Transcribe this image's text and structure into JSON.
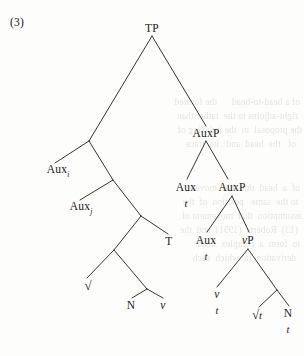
{
  "figure": {
    "example_number": "(3)",
    "type": "syntax-tree",
    "notation": "X-bar / bare phrase structure tree with traces"
  },
  "tree": {
    "root_label": "TP",
    "nodes": [
      {
        "id": "tp",
        "label": "TP",
        "x": 152,
        "y": 28,
        "style": "plain",
        "trace": null
      },
      {
        "id": "auxp1",
        "label": "AuxP",
        "x": 206,
        "y": 133,
        "style": "plain",
        "trace": null
      },
      {
        "id": "auxi",
        "label": "Aux",
        "x": 58,
        "y": 171,
        "style": "subscript",
        "subscript": "i",
        "trace": null
      },
      {
        "id": "auxj",
        "label": "Aux",
        "x": 81,
        "y": 208,
        "style": "subscript",
        "subscript": "j",
        "trace": null
      },
      {
        "id": "aux-t1",
        "label": "Aux",
        "x": 186,
        "y": 187,
        "style": "plain",
        "trace": "t"
      },
      {
        "id": "auxp2",
        "label": "AuxP",
        "x": 232,
        "y": 187,
        "style": "plain",
        "trace": null
      },
      {
        "id": "t-node",
        "label": "T",
        "x": 169,
        "y": 241,
        "style": "plain",
        "trace": null
      },
      {
        "id": "aux-t2",
        "label": "Aux",
        "x": 206,
        "y": 240,
        "style": "plain",
        "trace": "t"
      },
      {
        "id": "vp",
        "label": "vP",
        "x": 248,
        "y": 240,
        "style": "italic-v",
        "trace": null
      },
      {
        "id": "root-left",
        "label": "√",
        "x": 88,
        "y": 286,
        "style": "radical",
        "trace": null
      },
      {
        "id": "n-left",
        "label": "N",
        "x": 131,
        "y": 305,
        "style": "plain",
        "trace": null
      },
      {
        "id": "v-left",
        "label": "v",
        "x": 163,
        "y": 305,
        "style": "italic",
        "trace": null
      },
      {
        "id": "v-t",
        "label": "v",
        "x": 217,
        "y": 294,
        "style": "italic",
        "trace": "t"
      },
      {
        "id": "root-t",
        "label": "√t",
        "x": 257,
        "y": 315,
        "style": "radical-it",
        "trace": null
      },
      {
        "id": "n-t",
        "label": "N",
        "x": 288,
        "y": 313,
        "style": "plain",
        "trace": "t"
      }
    ],
    "terminal_traces": [
      "t",
      "t",
      "t",
      "t"
    ],
    "labels_flat": [
      "TP",
      "AuxP",
      "Aux i",
      "Aux j",
      "Aux",
      "t",
      "AuxP",
      "T",
      "Aux",
      "t",
      "vP",
      "√",
      "N",
      "v",
      "v",
      "t",
      "√t",
      "N",
      "t"
    ]
  },
  "edges": [
    {
      "from": "tp",
      "to": "n1",
      "x1": 152,
      "y1": 36,
      "x2": 89,
      "y2": 141
    },
    {
      "from": "tp",
      "to": "auxp1",
      "x1": 152,
      "y1": 36,
      "x2": 206,
      "y2": 126
    },
    {
      "from": "n1",
      "to": "auxi",
      "x1": 89,
      "y1": 141,
      "x2": 55,
      "y2": 163
    },
    {
      "from": "n1",
      "to": "n2",
      "x1": 89,
      "y1": 141,
      "x2": 113,
      "y2": 180
    },
    {
      "from": "n2",
      "to": "auxj",
      "x1": 113,
      "y1": 180,
      "x2": 80,
      "y2": 200
    },
    {
      "from": "n2",
      "to": "n3",
      "x1": 113,
      "y1": 180,
      "x2": 141,
      "y2": 216
    },
    {
      "from": "n3",
      "to": "n4",
      "x1": 141,
      "y1": 216,
      "x2": 114,
      "y2": 250
    },
    {
      "from": "n3",
      "to": "t-node",
      "x1": 141,
      "y1": 216,
      "x2": 168,
      "y2": 234
    },
    {
      "from": "n4",
      "to": "rootL",
      "x1": 114,
      "y1": 250,
      "x2": 87,
      "y2": 278
    },
    {
      "from": "n4",
      "to": "n5",
      "x1": 114,
      "y1": 250,
      "x2": 147,
      "y2": 289
    },
    {
      "from": "n5",
      "to": "n-left",
      "x1": 147,
      "y1": 289,
      "x2": 132,
      "y2": 298
    },
    {
      "from": "n5",
      "to": "v-left",
      "x1": 147,
      "y1": 289,
      "x2": 163,
      "y2": 298
    },
    {
      "from": "auxp1",
      "to": "aux-t1",
      "x1": 206,
      "y1": 141,
      "x2": 187,
      "y2": 179
    },
    {
      "from": "auxp1",
      "to": "auxp2",
      "x1": 206,
      "y1": 141,
      "x2": 228,
      "y2": 179
    },
    {
      "from": "auxp2",
      "to": "aux-t2",
      "x1": 232,
      "y1": 196,
      "x2": 207,
      "y2": 232
    },
    {
      "from": "auxp2",
      "to": "vp",
      "x1": 232,
      "y1": 196,
      "x2": 249,
      "y2": 232
    },
    {
      "from": "vp",
      "to": "v-t",
      "x1": 248,
      "y1": 249,
      "x2": 217,
      "y2": 287
    },
    {
      "from": "vp",
      "to": "n6",
      "x1": 248,
      "y1": 249,
      "x2": 277,
      "y2": 290
    },
    {
      "from": "n6",
      "to": "root-t",
      "x1": 277,
      "y1": 290,
      "x2": 259,
      "y2": 307
    },
    {
      "from": "n6",
      "to": "n-t",
      "x1": 277,
      "y1": 290,
      "x2": 289,
      "y2": 306
    }
  ],
  "bleed_text": {
    "note": "faint mirrored show-through from reverse page side",
    "lines": [
      {
        "x": 4,
        "y": 96,
        "text": "of a head-to-head      the formed"
      },
      {
        "x": 6,
        "y": 110,
        "text": "right-adjoins to the  rather than"
      },
      {
        "x": 2,
        "y": 124,
        "text": "the proposal  in  the indexing of"
      },
      {
        "x": 8,
        "y": 138,
        "text": "of   the  head  and   its  trace"
      },
      {
        "x": 4,
        "y": 182,
        "text": "of  a  head  that  has  moved"
      },
      {
        "x": 6,
        "y": 196,
        "text": "to the  same   position  of  the"
      },
      {
        "x": 2,
        "y": 210,
        "text": "assumption  that  movement of"
      },
      {
        "x": 6,
        "y": 224,
        "text": "(13)  Roberts  (1991)  and  the"
      },
      {
        "x": 4,
        "y": 238,
        "text": "to  form  a  complex  head"
      },
      {
        "x": 8,
        "y": 252,
        "text": "derivation  in  which  each"
      }
    ]
  }
}
